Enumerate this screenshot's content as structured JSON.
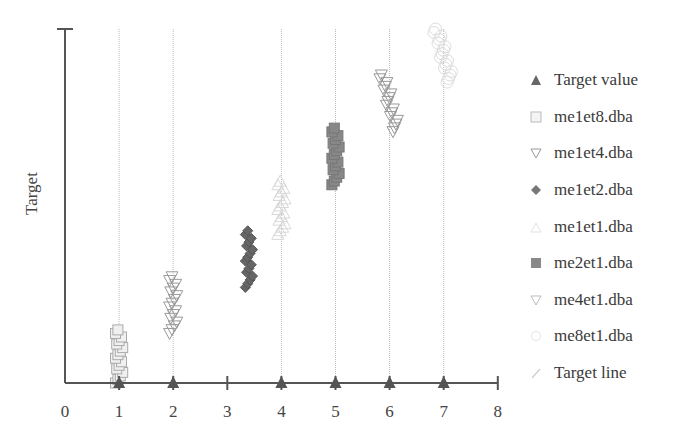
{
  "chart_data": {
    "type": "scatter",
    "title": "",
    "xlabel": "",
    "ylabel": "Target",
    "xlim": [
      0,
      8
    ],
    "xticks": [
      "0",
      "1",
      "2",
      "3",
      "4",
      "5",
      "6",
      "7",
      "8"
    ],
    "grid": "vertical dotted lines at target values",
    "legend_position": "right",
    "series": [
      {
        "name": "Target value",
        "marker": "triangle",
        "x": [
          1,
          2,
          4,
          5,
          6,
          7
        ],
        "y": [
          0,
          0,
          0,
          0,
          0,
          0
        ]
      },
      {
        "name": "me1et8.dba",
        "marker": "square-open",
        "cluster_x": 1,
        "y_range": [
          0.0,
          0.15
        ]
      },
      {
        "name": "me1et4.dba",
        "marker": "triangle-down-open",
        "cluster_x": 2,
        "y_range": [
          0.14,
          0.3
        ]
      },
      {
        "name": "me1et2.dba",
        "marker": "diamond-filled",
        "cluster_x": 3.4,
        "y_range": [
          0.27,
          0.43
        ]
      },
      {
        "name": "me1et1.dba",
        "marker": "triangle-open-light",
        "cluster_x": 4,
        "y_range": [
          0.42,
          0.57
        ]
      },
      {
        "name": "me2et1.dba",
        "marker": "square-filled",
        "cluster_x": 5,
        "y_range": [
          0.56,
          0.72
        ]
      },
      {
        "name": "me4et1.dba",
        "marker": "triangle-down-open",
        "cluster_x": 6,
        "y_range": [
          0.71,
          0.87
        ]
      },
      {
        "name": "me8et1.dba",
        "marker": "circle-open-light",
        "cluster_x": 7,
        "y_range": [
          0.85,
          1.0
        ]
      },
      {
        "name": "Target line",
        "marker": "line",
        "x": [
          1,
          2,
          4,
          5,
          6,
          7
        ]
      }
    ]
  },
  "legend": {
    "items": [
      {
        "label": "Target value",
        "icon": "triangle-icon"
      },
      {
        "label": "me1et8.dba",
        "icon": "square-open-icon"
      },
      {
        "label": "me1et4.dba",
        "icon": "triangle-down-open-icon"
      },
      {
        "label": "me1et2.dba",
        "icon": "diamond-icon"
      },
      {
        "label": "me1et1.dba",
        "icon": "triangle-light-icon"
      },
      {
        "label": "me2et1.dba",
        "icon": "square-filled-icon"
      },
      {
        "label": "me4et1.dba",
        "icon": "triangle-down-open-icon"
      },
      {
        "label": "me8et1.dba",
        "icon": "circle-open-icon"
      },
      {
        "label": "Target line",
        "icon": "line-icon"
      }
    ]
  },
  "axis": {
    "ylabel": "Target",
    "xticks": [
      "0",
      "1",
      "2",
      "3",
      "4",
      "5",
      "6",
      "7",
      "8"
    ]
  }
}
